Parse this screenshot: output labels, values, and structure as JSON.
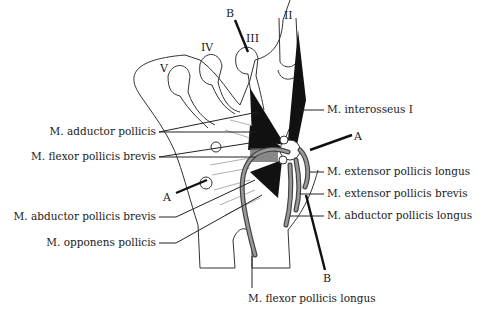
{
  "figure": {
    "digit_labels": [
      "V",
      "IV",
      "III",
      "II"
    ],
    "axis_labels": {
      "A_left": "A",
      "A_right": "A",
      "B_top": "B",
      "B_bottom": "B"
    },
    "left_labels": [
      "M. adductor pollicis",
      "M. flexor pollicis brevis",
      "M. abductor pollicis brevis",
      "M. opponens pollicis"
    ],
    "right_labels": [
      "M. interosseus I",
      "M. extensor pollicis longus",
      "M. extensor pollicis brevis",
      "M. abductor pollicis longus"
    ],
    "bottom_label": "M. flexor pollicis longus"
  }
}
